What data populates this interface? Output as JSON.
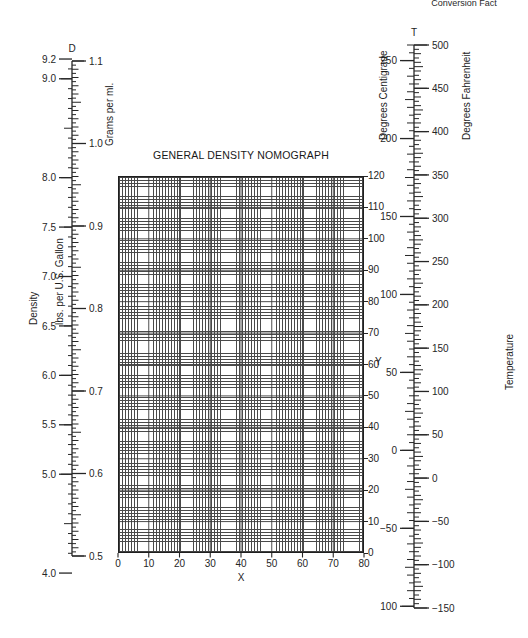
{
  "header": {
    "running_head": "Conversion Fact"
  },
  "chart_data": {
    "type": "nomograph",
    "title": "GENERAL DENSITY NOMOGRAPH",
    "xlabel": "X",
    "ylabel": "Y",
    "xlim": [
      0,
      80
    ],
    "ylim": [
      0,
      120
    ],
    "grid": true,
    "x_ticks": [
      0,
      10,
      20,
      30,
      40,
      50,
      60,
      70,
      80
    ],
    "y_ticks": [
      0,
      10,
      20,
      30,
      40,
      50,
      60,
      70,
      80,
      90,
      100,
      110,
      120
    ],
    "x_minor_step": 1,
    "y_minor_step": 1,
    "scales": [
      {
        "id": "D",
        "key_label": "D",
        "group_label": "Density",
        "left": {
          "name": "lbs. per U.S. Gallon",
          "lim": [
            4.0,
            9.2
          ],
          "ticks": [
            4.0,
            5.0,
            5.5,
            6.0,
            6.5,
            7.0,
            7.5,
            8.0,
            9.0,
            9.2
          ],
          "tick_labels": [
            "4.0",
            "5.0",
            "5.5",
            "6.0",
            "6.5",
            "7.0",
            "7.5",
            "8.0",
            "9.0",
            "9.2"
          ]
        },
        "right": {
          "name": "Grams per ml.",
          "lim": [
            0.5,
            1.1
          ],
          "ticks": [
            0.5,
            0.6,
            0.7,
            0.8,
            0.9,
            1.0,
            1.1
          ],
          "tick_labels": [
            "0.5",
            "0.6",
            "0.7",
            "0.8",
            "0.9",
            "1.0",
            "1.1"
          ]
        }
      },
      {
        "id": "T",
        "key_label": "T",
        "group_label": "Temperature",
        "left": {
          "name": "Degrees Centigrade",
          "lim": [
            -100,
            260
          ],
          "ticks": [
            -100,
            -50,
            0,
            50,
            100,
            150,
            200,
            250
          ],
          "tick_labels": [
            "−100",
            "−50",
            "0",
            "50",
            "100",
            "150",
            "200",
            "250"
          ]
        },
        "right": {
          "name": "Degrees Fahrenheit",
          "lim": [
            -150,
            500
          ],
          "ticks": [
            -150,
            -100,
            -50,
            0,
            50,
            100,
            150,
            200,
            250,
            300,
            350,
            400,
            450,
            500
          ],
          "tick_labels": [
            "−150",
            "−100",
            "−50",
            "0",
            "50",
            "100",
            "150",
            "200",
            "250",
            "300",
            "350",
            "400",
            "450",
            "500"
          ]
        }
      }
    ],
    "colors": {
      "ink": "#262626",
      "grid": "#4a4a4a",
      "background": "#ffffff"
    }
  }
}
